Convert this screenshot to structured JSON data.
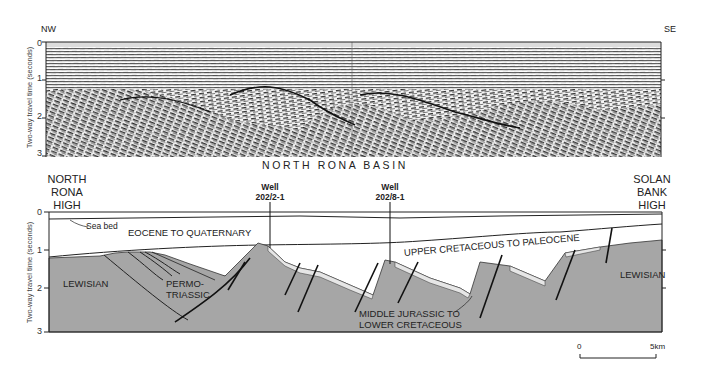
{
  "seismic_section": {
    "left_label": "NW",
    "right_label": "SE",
    "y_axis_label": "Two-way travel time (seconds)",
    "y_ticks": [
      "0",
      "1",
      "2",
      "3"
    ]
  },
  "interpretation": {
    "basin_title": "NORTH RONA BASIN",
    "left_high": [
      "NORTH",
      "RONA",
      "HIGH"
    ],
    "right_high": [
      "SOLAN",
      "BANK",
      "HIGH"
    ],
    "y_axis_label": "Two-way travel time (seconds)",
    "y_ticks": [
      "0",
      "1",
      "2",
      "3"
    ],
    "wells": [
      {
        "label": "Well",
        "id": "202/2-1"
      },
      {
        "label": "Well",
        "id": "202/8-1"
      }
    ],
    "annotations": {
      "sea_bed": "Sea bed"
    },
    "units": {
      "eocene_quaternary": "EOCENE TO QUATERNARY",
      "upper_cretaceous_paleocene": "UPPER CRETACEOUS TO PALEOCENE",
      "lewisian_left": "LEWISIAN",
      "lewisian_right": "LEWISIAN",
      "permo_triassic_1": "PERMO-",
      "permo_triassic_2": "TRIASSIC",
      "middle_jurassic_1": "MIDDLE JURASSIC TO",
      "middle_jurassic_2": "LOWER CRETACEOUS"
    },
    "colors": {
      "basement": "#a6a6a6",
      "thin_layer": "#e6e6e6",
      "water": "#ffffff",
      "lines": "#1a1a1a"
    }
  },
  "scale_bar": {
    "start": "0",
    "end": "5km"
  }
}
